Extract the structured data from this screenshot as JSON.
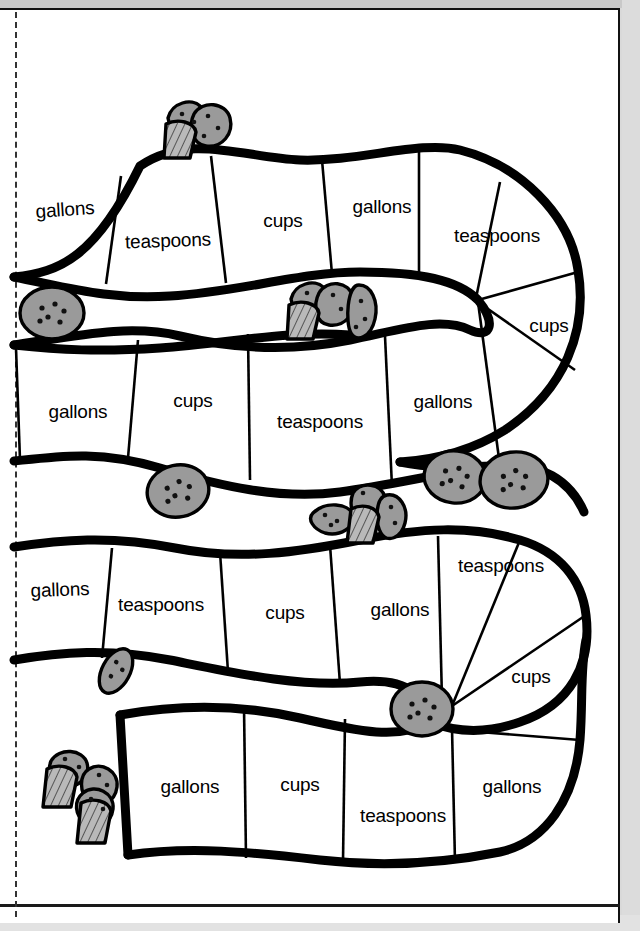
{
  "page": {
    "background_color": "#ffffff",
    "outer_background_color": "#d9d9d9",
    "line_color": "#000000",
    "cookie_fill_color": "#9a9a9a",
    "fold_line_style": "dashed"
  },
  "units": {
    "gallons": "gallons",
    "cups": "cups",
    "teaspoons": "teaspoons"
  },
  "rows": [
    {
      "row_index": 1,
      "cells": [
        {
          "label": "gallons",
          "x": 65,
          "y": 210,
          "rotate": -4
        },
        {
          "label": "teaspoons",
          "x": 168,
          "y": 241,
          "rotate": -2
        },
        {
          "label": "cups",
          "x": 283,
          "y": 221,
          "rotate": 0
        },
        {
          "label": "gallons",
          "x": 382,
          "y": 207,
          "rotate": 0
        },
        {
          "label": "teaspoons",
          "x": 497,
          "y": 236,
          "rotate": 0
        },
        {
          "label": "cups",
          "x": 549,
          "y": 326,
          "rotate": 0
        }
      ]
    },
    {
      "row_index": 2,
      "cells": [
        {
          "label": "gallons",
          "x": 78,
          "y": 412,
          "rotate": 0
        },
        {
          "label": "cups",
          "x": 193,
          "y": 401,
          "rotate": 0
        },
        {
          "label": "teaspoons",
          "x": 320,
          "y": 422,
          "rotate": 0
        },
        {
          "label": "gallons",
          "x": 443,
          "y": 402,
          "rotate": 0
        }
      ]
    },
    {
      "row_index": 3,
      "cells": [
        {
          "label": "gallons",
          "x": 60,
          "y": 590,
          "rotate": -2
        },
        {
          "label": "teaspoons",
          "x": 161,
          "y": 605,
          "rotate": 0
        },
        {
          "label": "cups",
          "x": 285,
          "y": 613,
          "rotate": 0
        },
        {
          "label": "gallons",
          "x": 400,
          "y": 610,
          "rotate": 0
        },
        {
          "label": "teaspoons",
          "x": 501,
          "y": 566,
          "rotate": 0
        },
        {
          "label": "cups",
          "x": 531,
          "y": 677,
          "rotate": 0
        }
      ]
    },
    {
      "row_index": 4,
      "cells": [
        {
          "label": "gallons",
          "x": 190,
          "y": 787,
          "rotate": 0
        },
        {
          "label": "cups",
          "x": 300,
          "y": 785,
          "rotate": 0
        },
        {
          "label": "teaspoons",
          "x": 403,
          "y": 816,
          "rotate": 0
        },
        {
          "label": "gallons",
          "x": 512,
          "y": 787,
          "rotate": 0
        }
      ]
    }
  ],
  "decorations": [
    {
      "type": "muffin-and-cookies",
      "name": "muffin-cluster-top",
      "x": 196,
      "y": 132
    },
    {
      "type": "cookie",
      "name": "cookie-left-row1",
      "x": 52,
      "y": 313
    },
    {
      "type": "muffin-and-cookies",
      "name": "muffin-cluster-mid",
      "x": 325,
      "y": 309
    },
    {
      "type": "cookie",
      "name": "cookie-row2-left",
      "x": 178,
      "y": 491
    },
    {
      "type": "muffin-and-cookies",
      "name": "muffin-cluster-row2-right",
      "x": 383,
      "y": 515
    },
    {
      "type": "cookie",
      "name": "cookie-row2-far-right-a",
      "x": 455,
      "y": 477
    },
    {
      "type": "cookie",
      "name": "cookie-row2-far-right-b",
      "x": 514,
      "y": 480
    },
    {
      "type": "cookie",
      "name": "cookie-row3-small",
      "x": 116,
      "y": 671
    },
    {
      "type": "cookie",
      "name": "cookie-row3-right",
      "x": 422,
      "y": 709
    },
    {
      "type": "muffin-and-cookies",
      "name": "muffin-cluster-bottom-left",
      "x": 85,
      "y": 797
    }
  ]
}
